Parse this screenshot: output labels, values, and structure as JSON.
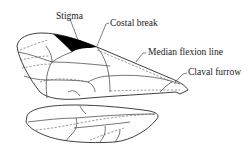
{
  "diagram": {
    "type": "insect wing venation",
    "labels": {
      "stigma": "Stigma",
      "costal_break": "Costal break",
      "median_flexion_line": "Median flexion line",
      "claval_furrow": "Claval furrow"
    },
    "parts": [
      "forewing",
      "hindwing"
    ],
    "colors": {
      "line": "#2a2a2a",
      "stigma_fill": "#000000",
      "background": "#ffffff"
    }
  }
}
